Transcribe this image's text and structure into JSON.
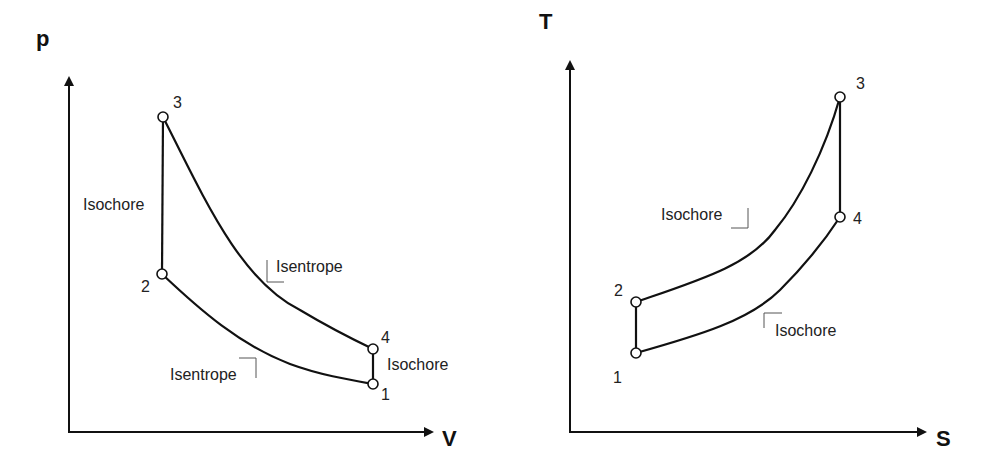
{
  "diagrams": [
    {
      "name": "pv-diagram",
      "y_axis_label": "p",
      "x_axis_label": "V",
      "points": [
        {
          "label": "1",
          "x": 373,
          "y": 384
        },
        {
          "label": "2",
          "x": 162,
          "y": 274
        },
        {
          "label": "3",
          "x": 163,
          "y": 117
        },
        {
          "label": "4",
          "x": 373,
          "y": 349
        }
      ],
      "processes": [
        {
          "from": "1",
          "to": "2",
          "label": "Isentrope"
        },
        {
          "from": "2",
          "to": "3",
          "label": "Isochore"
        },
        {
          "from": "3",
          "to": "4",
          "label": "Isentrope"
        },
        {
          "from": "4",
          "to": "1",
          "label": "Isochore"
        }
      ]
    },
    {
      "name": "ts-diagram",
      "y_axis_label": "T",
      "x_axis_label": "S",
      "points": [
        {
          "label": "1",
          "x": 636,
          "y": 353
        },
        {
          "label": "2",
          "x": 636,
          "y": 302
        },
        {
          "label": "3",
          "x": 840,
          "y": 97
        },
        {
          "label": "4",
          "x": 840,
          "y": 217
        }
      ],
      "processes": [
        {
          "from": "1",
          "to": "2",
          "label": "Isentrope"
        },
        {
          "from": "2",
          "to": "3",
          "label": "Isochore"
        },
        {
          "from": "3",
          "to": "4",
          "label": "Isentrope"
        },
        {
          "from": "4",
          "to": "1",
          "label": "Isochore"
        }
      ]
    }
  ],
  "labels": {
    "pv_isochore_left": "Isochore",
    "pv_isentrope_upper": "Isentrope",
    "pv_isentrope_lower": "Isentrope",
    "pv_isochore_right": "Isochore",
    "ts_isochore_upper": "Isochore",
    "ts_isochore_lower": "Isochore"
  }
}
